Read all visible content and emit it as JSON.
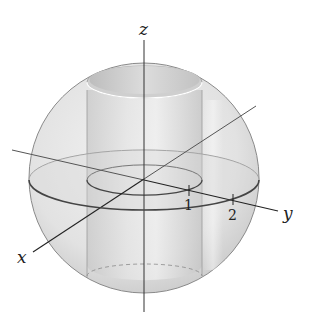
{
  "figure": {
    "axes": {
      "x_label": "x",
      "y_label": "y",
      "z_label": "z"
    },
    "ticks": [
      {
        "label": "1",
        "axis": "y"
      },
      {
        "label": "2",
        "axis": "y"
      }
    ],
    "colors": {
      "sphere_fill": "#e6e6e6",
      "sphere_edge": "#8a8a8a",
      "cylinder_fill": "#d2d2d2",
      "axis_line": "#222222",
      "equator": "#555555"
    }
  }
}
